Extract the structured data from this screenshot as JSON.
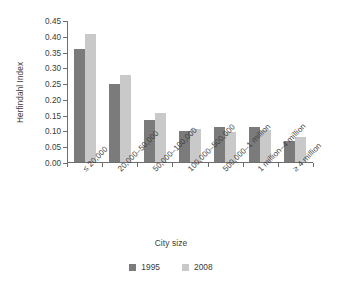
{
  "chart_data": {
    "type": "bar",
    "title": "",
    "xlabel": "City size",
    "ylabel": "Herfindahl Index",
    "ylim": [
      0.0,
      0.45
    ],
    "ytick_labels": [
      "0.00",
      "0.05",
      "0.10",
      "0.15",
      "0.20",
      "0.25",
      "0.30",
      "0.35",
      "0.40",
      "0.45"
    ],
    "ytick_values": [
      0.0,
      0.05,
      0.1,
      0.15,
      0.2,
      0.25,
      0.3,
      0.35,
      0.4,
      0.45
    ],
    "grid": false,
    "legend_position": "bottom",
    "categories": [
      "≤ 20,000",
      "20,000–50,000",
      "50,000–100,000",
      "100,000–500,000",
      "500,000–1 million",
      "1 million–4 million",
      "≥ 4 million"
    ],
    "series": [
      {
        "name": "1995",
        "color": "#7b7b7b",
        "values": [
          0.362,
          0.249,
          0.135,
          0.098,
          0.112,
          0.112,
          0.066
        ]
      },
      {
        "name": "2008",
        "color": "#c9c9c9",
        "values": [
          0.409,
          0.278,
          0.158,
          0.105,
          0.097,
          0.103,
          0.08
        ]
      }
    ]
  }
}
